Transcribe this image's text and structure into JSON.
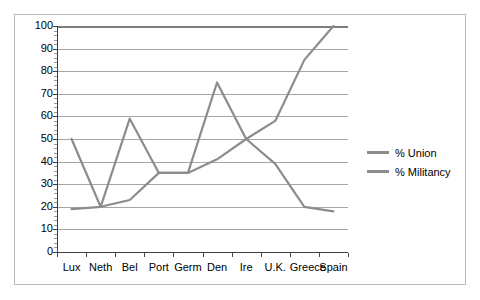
{
  "chart_data": {
    "type": "line",
    "title": "",
    "xlabel": "",
    "ylabel": "",
    "ylim": [
      0,
      100
    ],
    "ytick_step": 10,
    "grid": true,
    "legend_position": "right",
    "categories": [
      "Lux",
      "Neth",
      "Bel",
      "Port",
      "Germ",
      "Den",
      "Ire",
      "U.K.",
      "Greece",
      "Spain"
    ],
    "ytick_labels": [
      "100",
      "90",
      "80",
      "70",
      "60",
      "50",
      "40",
      "30",
      "20",
      "10",
      "0"
    ],
    "series": [
      {
        "name": "% Union",
        "color": "#8c8c8c",
        "values": [
          19,
          20,
          23,
          35,
          35,
          41,
          50,
          58,
          85,
          100
        ]
      },
      {
        "name": "% Militancy",
        "color": "#8c8c8c",
        "values": [
          50,
          20,
          59,
          35,
          35,
          75,
          50,
          39,
          20,
          18
        ]
      }
    ]
  },
  "legend": {
    "items": [
      {
        "label": "% Union"
      },
      {
        "label": "% Militancy"
      }
    ]
  },
  "colors": {
    "line": "#8c8c8c",
    "gridline": "#a6a6a6",
    "axis": "#3f3f3f",
    "frame_border": "#b9b9b9",
    "background": "#ffffff"
  }
}
